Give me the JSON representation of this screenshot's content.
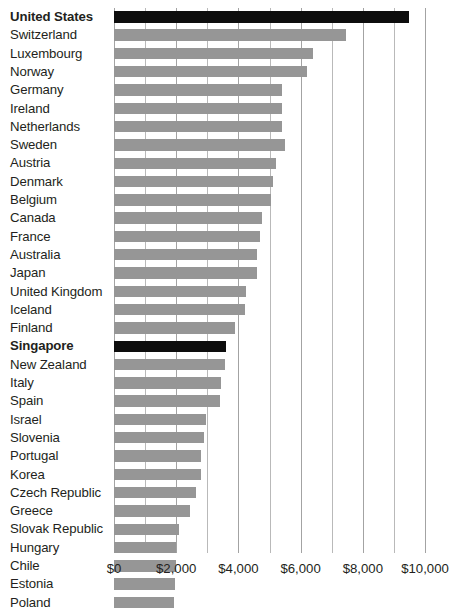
{
  "chart_data": {
    "type": "bar",
    "orientation": "horizontal",
    "title": "",
    "subtitle": "",
    "xlabel": "",
    "ylabel": "",
    "xlim": [
      0,
      10500
    ],
    "tick_values": [
      0,
      2000,
      4000,
      6000,
      8000,
      10000
    ],
    "tick_labels": [
      "$0",
      "$2,000",
      "$4,000",
      "$6,000",
      "$8,000",
      "$10,000"
    ],
    "gridline_interval": 1000,
    "grid": true,
    "legend": "none",
    "bar_color": "#969696",
    "highlight_color": "#0d0d0d",
    "highlighted_categories": [
      "United States",
      "Singapore"
    ],
    "categories": [
      "United States",
      "Switzerland",
      "Luxembourg",
      "Norway",
      "Germany",
      "Ireland",
      "Netherlands",
      "Sweden",
      "Austria",
      "Denmark",
      "Belgium",
      "Canada",
      "France",
      "Australia",
      "Japan",
      "United Kingdom",
      "Iceland",
      "Finland",
      "Singapore",
      "New Zealand",
      "Italy",
      "Spain",
      "Israel",
      "Slovenia",
      "Portugal",
      "Korea",
      "Czech Republic",
      "Greece",
      "Slovak Republic",
      "Hungary",
      "Chile",
      "Estonia",
      "Poland"
    ],
    "values": [
      9500,
      7450,
      6400,
      6200,
      5400,
      5400,
      5400,
      5500,
      5200,
      5100,
      5050,
      4750,
      4700,
      4600,
      4600,
      4250,
      4200,
      3900,
      3600,
      3560,
      3450,
      3400,
      2950,
      2900,
      2800,
      2800,
      2650,
      2450,
      2100,
      2000,
      1980,
      1960,
      1920
    ],
    "bars": [
      {
        "label": "United States",
        "value": 9500,
        "highlight": true
      },
      {
        "label": "Switzerland",
        "value": 7450,
        "highlight": false
      },
      {
        "label": "Luxembourg",
        "value": 6400,
        "highlight": false
      },
      {
        "label": "Norway",
        "value": 6200,
        "highlight": false
      },
      {
        "label": "Germany",
        "value": 5400,
        "highlight": false
      },
      {
        "label": "Ireland",
        "value": 5400,
        "highlight": false
      },
      {
        "label": "Netherlands",
        "value": 5400,
        "highlight": false
      },
      {
        "label": "Sweden",
        "value": 5500,
        "highlight": false
      },
      {
        "label": "Austria",
        "value": 5200,
        "highlight": false
      },
      {
        "label": "Denmark",
        "value": 5100,
        "highlight": false
      },
      {
        "label": "Belgium",
        "value": 5050,
        "highlight": false
      },
      {
        "label": "Canada",
        "value": 4750,
        "highlight": false
      },
      {
        "label": "France",
        "value": 4700,
        "highlight": false
      },
      {
        "label": "Australia",
        "value": 4600,
        "highlight": false
      },
      {
        "label": "Japan",
        "value": 4600,
        "highlight": false
      },
      {
        "label": "United Kingdom",
        "value": 4250,
        "highlight": false
      },
      {
        "label": "Iceland",
        "value": 4200,
        "highlight": false
      },
      {
        "label": "Finland",
        "value": 3900,
        "highlight": false
      },
      {
        "label": "Singapore",
        "value": 3600,
        "highlight": true
      },
      {
        "label": "New Zealand",
        "value": 3560,
        "highlight": false
      },
      {
        "label": "Italy",
        "value": 3450,
        "highlight": false
      },
      {
        "label": "Spain",
        "value": 3400,
        "highlight": false
      },
      {
        "label": "Israel",
        "value": 2950,
        "highlight": false
      },
      {
        "label": "Slovenia",
        "value": 2900,
        "highlight": false
      },
      {
        "label": "Portugal",
        "value": 2800,
        "highlight": false
      },
      {
        "label": "Korea",
        "value": 2800,
        "highlight": false
      },
      {
        "label": "Czech Republic",
        "value": 2650,
        "highlight": false
      },
      {
        "label": "Greece",
        "value": 2450,
        "highlight": false
      },
      {
        "label": "Slovak Republic",
        "value": 2100,
        "highlight": false
      },
      {
        "label": "Hungary",
        "value": 2000,
        "highlight": false
      },
      {
        "label": "Chile",
        "value": 1980,
        "highlight": false
      },
      {
        "label": "Estonia",
        "value": 1960,
        "highlight": false
      },
      {
        "label": "Poland",
        "value": 1920,
        "highlight": false
      }
    ]
  }
}
